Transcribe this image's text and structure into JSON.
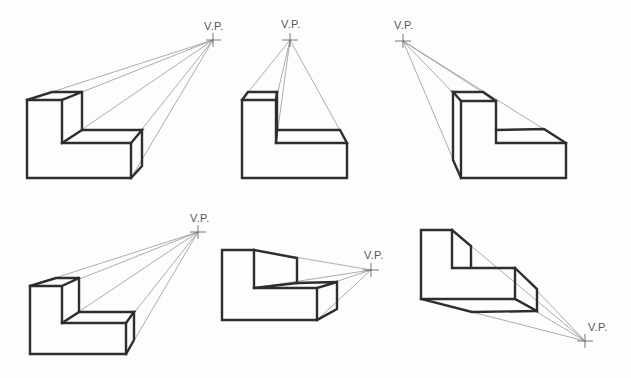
{
  "diagram": {
    "vp_label": "V.P.",
    "figures": [
      {
        "id": "fig1",
        "vp": [
          213,
          40
        ],
        "label_pos": [
          204,
          20
        ]
      },
      {
        "id": "fig2",
        "vp": [
          290,
          40
        ],
        "label_pos": [
          281,
          18
        ]
      },
      {
        "id": "fig3",
        "vp": [
          403,
          41
        ],
        "label_pos": [
          394,
          19
        ]
      },
      {
        "id": "fig4",
        "vp": [
          198,
          232
        ],
        "label_pos": [
          190,
          212
        ]
      },
      {
        "id": "fig5",
        "vp": [
          371,
          270
        ],
        "label_pos": [
          364,
          249
        ]
      },
      {
        "id": "fig6",
        "vp": [
          585,
          341
        ],
        "label_pos": [
          584,
          321
        ]
      }
    ],
    "colors": {
      "edge": "#2e2e2e",
      "projection": "#8a8a8a",
      "background": "#fdfdfd"
    }
  }
}
